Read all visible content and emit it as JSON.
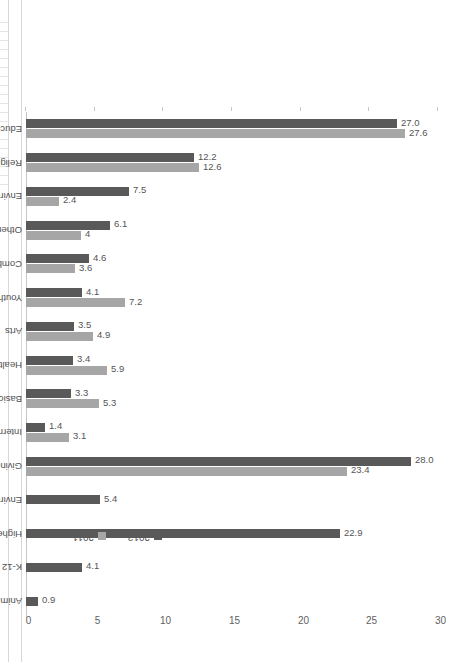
{
  "figure": {
    "edge_title_fragment": "",
    "orientation": "rotated-90"
  },
  "legend": {
    "position": "right",
    "items": [
      {
        "label": "2013",
        "color": "#595959"
      },
      {
        "label": "2011",
        "color": "#a6a6a6"
      }
    ]
  },
  "chart_data": {
    "type": "bar",
    "title": "",
    "subtitle": "",
    "xlabel": "",
    "ylabel": "",
    "ylim": [
      0,
      30
    ],
    "yticks": [
      0,
      5,
      10,
      15,
      20,
      25,
      30
    ],
    "ytick_labels": [
      "0",
      "5",
      "10",
      "15",
      "20",
      "25",
      "30"
    ],
    "grid": false,
    "legend_position": "right",
    "categories": [
      "Education",
      "Religious",
      "Environment/Animal Care",
      "Other",
      "Combination",
      "Youth/Family Services",
      "Arts",
      "Health",
      "Basic Needs",
      "International",
      "Giving Vehicles",
      "Environment",
      "Higher Education",
      "K-12 Education",
      "Animals"
    ],
    "series": [
      {
        "name": "2013",
        "color": "#595959",
        "values": [
          27.0,
          12.2,
          7.5,
          6.1,
          4.6,
          4.1,
          3.5,
          3.4,
          3.3,
          1.4,
          28.0,
          5.4,
          22.9,
          4.1,
          0.9
        ],
        "labels": [
          "27.0",
          "12.2",
          "7.5",
          "6.1",
          "4.6",
          "4.1",
          "3.5",
          "3.4",
          "3.3",
          "1.4",
          "28.0",
          "5.4",
          "22.9",
          "4.1",
          "0.9"
        ]
      },
      {
        "name": "2011",
        "color": "#a6a6a6",
        "values": [
          27.6,
          12.6,
          2.4,
          4.0,
          3.6,
          7.2,
          4.9,
          5.9,
          5.3,
          3.1,
          23.4,
          null,
          null,
          null,
          null
        ],
        "labels": [
          "27.6",
          "12.6",
          "2.4",
          "4",
          "3.6",
          "7.2",
          "4.9",
          "5.9",
          "5.3",
          "3.1",
          "23.4",
          "",
          "",
          "",
          ""
        ]
      }
    ]
  }
}
